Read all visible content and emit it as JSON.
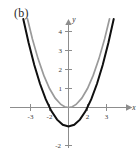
{
  "figure": {
    "panel_label": "(b)",
    "axis_labels": {
      "x": "x",
      "y": "y"
    }
  },
  "chart_data": {
    "type": "line",
    "title": "(b)",
    "xlabel": "x",
    "ylabel": "y",
    "grid": false,
    "legend": "none",
    "xlim": [
      -3.6,
      3.8
    ],
    "ylim": [
      -2.4,
      4.9
    ],
    "xticks": [
      -3,
      -2,
      2,
      3
    ],
    "xticklabels": [
      "-3",
      "-2",
      "2",
      "3"
    ],
    "yticks": [
      -2,
      1,
      2,
      3,
      4
    ],
    "yticklabels": [
      "-2",
      "1",
      "2",
      "3",
      "4"
    ],
    "series": [
      {
        "name": "gray-parabola",
        "color": "#9a9a9a",
        "equation": "y = x^2",
        "vertex": [
          0,
          0
        ],
        "x": [
          -2.16,
          -1.9,
          -1.6,
          -1.3,
          -1.0,
          -0.7,
          -0.4,
          -0.2,
          0,
          0.2,
          0.4,
          0.7,
          1.0,
          1.3,
          1.6,
          1.9,
          2.16
        ],
        "values": [
          4.67,
          3.61,
          2.56,
          1.69,
          1.0,
          0.49,
          0.16,
          0.04,
          0,
          0.04,
          0.16,
          0.49,
          1.0,
          1.69,
          2.56,
          3.61,
          4.67
        ]
      },
      {
        "name": "black-parabola",
        "color": "#101010",
        "equation": "y = x^2 - 1",
        "vertex": [
          0,
          -1
        ],
        "x": [
          -2.38,
          -2.1,
          -1.8,
          -1.5,
          -1.2,
          -0.9,
          -0.6,
          -0.3,
          0,
          0.3,
          0.6,
          0.9,
          1.2,
          1.5,
          1.8,
          2.1,
          2.38
        ],
        "values": [
          4.66,
          3.41,
          2.24,
          1.25,
          0.44,
          -0.19,
          -0.64,
          -0.91,
          -1.0,
          -0.91,
          -0.64,
          -0.19,
          0.44,
          1.25,
          2.24,
          3.41,
          4.66
        ]
      }
    ]
  }
}
